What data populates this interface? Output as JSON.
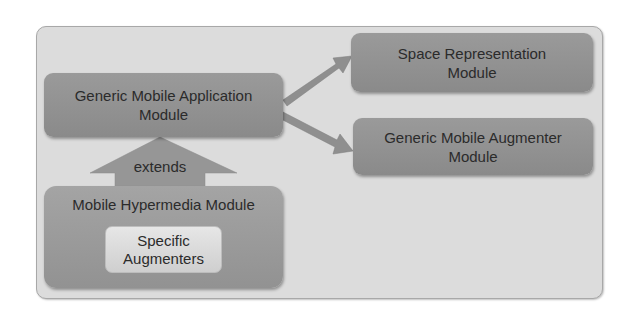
{
  "diagram": {
    "modules": {
      "generic_mobile_application": {
        "line1": "Generic Mobile Application",
        "line2": "Module"
      },
      "space_representation": {
        "line1": "Space Representation",
        "line2": "Module"
      },
      "generic_mobile_augmenter": {
        "line1": "Generic Mobile Augmenter",
        "line2": "Module"
      },
      "mobile_hypermedia": {
        "label": "Mobile Hypermedia Module"
      },
      "specific_augmenters": {
        "line1": "Specific",
        "line2": "Augmenters"
      }
    },
    "relations": [
      {
        "from": "Generic Mobile Application Module",
        "to": "Space Representation Module",
        "type": "arrow"
      },
      {
        "from": "Generic Mobile Application Module",
        "to": "Generic Mobile Augmenter Module",
        "type": "arrow"
      },
      {
        "from": "Mobile Hypermedia Module",
        "to": "Generic Mobile Application Module",
        "type": "extends",
        "label": "extends"
      }
    ],
    "colors": {
      "frame": "#dcdcdc",
      "module": "#909090",
      "inner": "#dedede",
      "text": "#2b2b2b"
    }
  }
}
